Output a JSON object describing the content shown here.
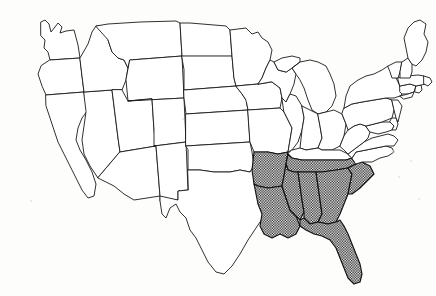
{
  "figure": {
    "kind": "choropleth-outline-map",
    "region": "Contiguous United States",
    "title": "",
    "caption": "",
    "background_color": "#fdfdfc",
    "outline_color": "#1a1a1a",
    "highlight_fill": "crosshatch",
    "highlight_color": "#111111",
    "unhighlighted_fill": "#ffffff",
    "legend_visible": false,
    "labels_visible": false,
    "width_px": 436,
    "height_px": 296
  },
  "map_data": {
    "type": "map",
    "projection_hint": "conic",
    "highlighted_count": 11,
    "unhighlighted_count": 37,
    "highlighted_states": [
      "Arkansas",
      "Louisiana",
      "Mississippi",
      "Tennessee",
      "Alabama",
      "Georgia",
      "Florida",
      "South Carolina"
    ],
    "states": [
      {
        "name": "Washington",
        "abbr": "WA",
        "highlighted": false
      },
      {
        "name": "Oregon",
        "abbr": "OR",
        "highlighted": false
      },
      {
        "name": "California",
        "abbr": "CA",
        "highlighted": false
      },
      {
        "name": "Nevada",
        "abbr": "NV",
        "highlighted": false
      },
      {
        "name": "Idaho",
        "abbr": "ID",
        "highlighted": false
      },
      {
        "name": "Montana",
        "abbr": "MT",
        "highlighted": false
      },
      {
        "name": "Wyoming",
        "abbr": "WY",
        "highlighted": false
      },
      {
        "name": "Utah",
        "abbr": "UT",
        "highlighted": false
      },
      {
        "name": "Arizona",
        "abbr": "AZ",
        "highlighted": false
      },
      {
        "name": "Colorado",
        "abbr": "CO",
        "highlighted": false
      },
      {
        "name": "New Mexico",
        "abbr": "NM",
        "highlighted": false
      },
      {
        "name": "North Dakota",
        "abbr": "ND",
        "highlighted": false
      },
      {
        "name": "South Dakota",
        "abbr": "SD",
        "highlighted": false
      },
      {
        "name": "Nebraska",
        "abbr": "NE",
        "highlighted": false
      },
      {
        "name": "Kansas",
        "abbr": "KS",
        "highlighted": false
      },
      {
        "name": "Oklahoma",
        "abbr": "OK",
        "highlighted": false
      },
      {
        "name": "Texas",
        "abbr": "TX",
        "highlighted": false
      },
      {
        "name": "Minnesota",
        "abbr": "MN",
        "highlighted": false
      },
      {
        "name": "Iowa",
        "abbr": "IA",
        "highlighted": false
      },
      {
        "name": "Missouri",
        "abbr": "MO",
        "highlighted": false
      },
      {
        "name": "Arkansas",
        "abbr": "AR",
        "highlighted": true
      },
      {
        "name": "Louisiana",
        "abbr": "LA",
        "highlighted": true
      },
      {
        "name": "Wisconsin",
        "abbr": "WI",
        "highlighted": false
      },
      {
        "name": "Illinois",
        "abbr": "IL",
        "highlighted": false
      },
      {
        "name": "Michigan",
        "abbr": "MI",
        "highlighted": false
      },
      {
        "name": "Indiana",
        "abbr": "IN",
        "highlighted": false
      },
      {
        "name": "Ohio",
        "abbr": "OH",
        "highlighted": false
      },
      {
        "name": "Kentucky",
        "abbr": "KY",
        "highlighted": false
      },
      {
        "name": "Tennessee",
        "abbr": "TN",
        "highlighted": true
      },
      {
        "name": "Mississippi",
        "abbr": "MS",
        "highlighted": true
      },
      {
        "name": "Alabama",
        "abbr": "AL",
        "highlighted": true
      },
      {
        "name": "Georgia",
        "abbr": "GA",
        "highlighted": true
      },
      {
        "name": "Florida",
        "abbr": "FL",
        "highlighted": true
      },
      {
        "name": "South Carolina",
        "abbr": "SC",
        "highlighted": true
      },
      {
        "name": "North Carolina",
        "abbr": "NC",
        "highlighted": false
      },
      {
        "name": "Virginia",
        "abbr": "VA",
        "highlighted": false
      },
      {
        "name": "West Virginia",
        "abbr": "WV",
        "highlighted": false
      },
      {
        "name": "Maryland",
        "abbr": "MD",
        "highlighted": false
      },
      {
        "name": "Delaware",
        "abbr": "DE",
        "highlighted": false
      },
      {
        "name": "Pennsylvania",
        "abbr": "PA",
        "highlighted": false
      },
      {
        "name": "New Jersey",
        "abbr": "NJ",
        "highlighted": false
      },
      {
        "name": "New York",
        "abbr": "NY",
        "highlighted": false
      },
      {
        "name": "Connecticut",
        "abbr": "CT",
        "highlighted": false
      },
      {
        "name": "Rhode Island",
        "abbr": "RI",
        "highlighted": false
      },
      {
        "name": "Massachusetts",
        "abbr": "MA",
        "highlighted": false
      },
      {
        "name": "Vermont",
        "abbr": "VT",
        "highlighted": false
      },
      {
        "name": "New Hampshire",
        "abbr": "NH",
        "highlighted": false
      },
      {
        "name": "Maine",
        "abbr": "ME",
        "highlighted": false
      }
    ]
  }
}
